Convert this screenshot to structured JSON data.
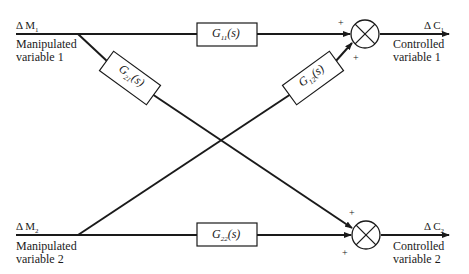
{
  "diagram": {
    "type": "multivariable block diagram (2x2 process interaction)",
    "inputs": [
      {
        "signal": "ΔM₁",
        "signal_base": "Δ M",
        "signal_sub": "1",
        "label_line1": "Manipulated",
        "label_line2": "variable 1"
      },
      {
        "signal": "ΔM₂",
        "signal_base": "Δ M",
        "signal_sub": "2",
        "label_line1": "Manipulated",
        "label_line2": "variable 2"
      }
    ],
    "outputs": [
      {
        "signal": "ΔC₁",
        "signal_base": "Δ C",
        "signal_sub": "1",
        "label_line1": "Controlled",
        "label_line2": "variable 1"
      },
      {
        "signal": "ΔC₂",
        "signal_base": "Δ C",
        "signal_sub": "2",
        "label_line1": "Controlled",
        "label_line2": "variable 2"
      }
    ],
    "blocks": [
      {
        "id": "G11",
        "base": "G",
        "sub": "11",
        "arg": "(s)",
        "from": "ΔM₁",
        "to": "sum1"
      },
      {
        "id": "G21",
        "base": "G",
        "sub": "21",
        "arg": "(s)",
        "from": "ΔM₁",
        "to": "sum2"
      },
      {
        "id": "G12",
        "base": "G",
        "sub": "12",
        "arg": "(s)",
        "from": "ΔM₂",
        "to": "sum1"
      },
      {
        "id": "G22",
        "base": "G",
        "sub": "22",
        "arg": "(s)",
        "from": "ΔM₂",
        "to": "sum2"
      }
    ],
    "summing_junctions": [
      {
        "id": "sum1",
        "signs": [
          "+",
          "+"
        ],
        "output": "ΔC₁"
      },
      {
        "id": "sum2",
        "signs": [
          "+",
          "+"
        ],
        "output": "ΔC₂"
      }
    ],
    "colors": {
      "line": "#1a1a1a",
      "background": "#ffffff"
    }
  }
}
